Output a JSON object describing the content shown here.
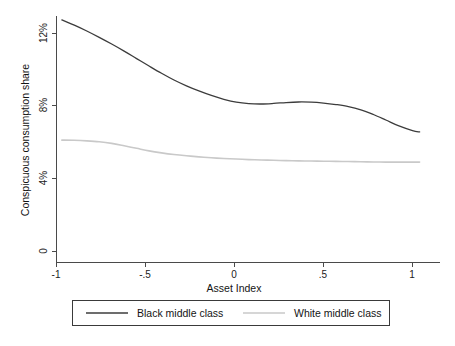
{
  "chart_data": {
    "type": "line",
    "title": "",
    "xlabel": "Asset Index",
    "ylabel": "Conspicuous consumption share",
    "xlim": [
      -1.07,
      1.06
    ],
    "ylim": [
      0,
      13.4
    ],
    "xticks": [
      -1,
      -0.5,
      0,
      0.5,
      1
    ],
    "xtick_labels": [
      "-1",
      "-.5",
      "0",
      ".5",
      "1"
    ],
    "yticks": [
      0,
      4,
      8,
      12
    ],
    "ytick_labels": [
      "0",
      "4%",
      "8%",
      "12%"
    ],
    "grid": false,
    "legend_position": "below-plot",
    "series": [
      {
        "name": "Black middle class",
        "color": "#3c3c3c",
        "width": 1.3,
        "x": [
          -0.97,
          -0.9,
          -0.83,
          -0.76,
          -0.69,
          -0.62,
          -0.55,
          -0.48,
          -0.41,
          -0.34,
          -0.27,
          -0.2,
          -0.13,
          -0.06,
          0.01,
          0.08,
          0.15,
          0.22,
          0.29,
          0.36,
          0.43,
          0.5,
          0.57,
          0.64,
          0.71,
          0.78,
          0.85,
          0.92,
          1.0,
          1.04
        ],
        "y": [
          12.75,
          12.46,
          12.14,
          11.79,
          11.42,
          11.03,
          10.62,
          10.21,
          9.81,
          9.44,
          9.12,
          8.84,
          8.59,
          8.38,
          8.22,
          8.14,
          8.12,
          8.15,
          8.2,
          8.23,
          8.22,
          8.17,
          8.09,
          7.98,
          7.8,
          7.54,
          7.24,
          6.93,
          6.66,
          6.58
        ]
      },
      {
        "name": "White middle class",
        "color": "#c9c9c9",
        "width": 1.6,
        "x": [
          -0.97,
          -0.9,
          -0.83,
          -0.76,
          -0.69,
          -0.62,
          -0.55,
          -0.48,
          -0.41,
          -0.34,
          -0.27,
          -0.2,
          -0.13,
          -0.06,
          0.01,
          0.08,
          0.15,
          0.22,
          0.29,
          0.36,
          0.43,
          0.5,
          0.57,
          0.64,
          0.71,
          0.78,
          0.85,
          0.92,
          1.0,
          1.04
        ],
        "y": [
          6.13,
          6.12,
          6.09,
          6.04,
          5.95,
          5.82,
          5.68,
          5.54,
          5.43,
          5.34,
          5.27,
          5.21,
          5.16,
          5.12,
          5.09,
          5.06,
          5.04,
          5.02,
          5.0,
          4.99,
          4.98,
          4.97,
          4.96,
          4.95,
          4.94,
          4.93,
          4.92,
          4.92,
          4.92,
          4.92
        ]
      }
    ]
  },
  "axes": {
    "y_title": "Conspicuous consumption share",
    "x_title": "Asset Index",
    "y_tick_labels": [
      "12%",
      "8%",
      "4%",
      "0"
    ],
    "x_tick_labels": [
      "-1",
      "-.5",
      "0",
      ".5",
      "1"
    ]
  },
  "legend": {
    "entries": [
      {
        "label": "Black middle class",
        "color": "#3c3c3c"
      },
      {
        "label": "White middle class",
        "color": "#c9c9c9"
      }
    ]
  },
  "colors": {
    "black_series": "#3c3c3c",
    "white_series": "#c9c9c9",
    "axis": "#4a4a4a",
    "background": "#ffffff"
  }
}
